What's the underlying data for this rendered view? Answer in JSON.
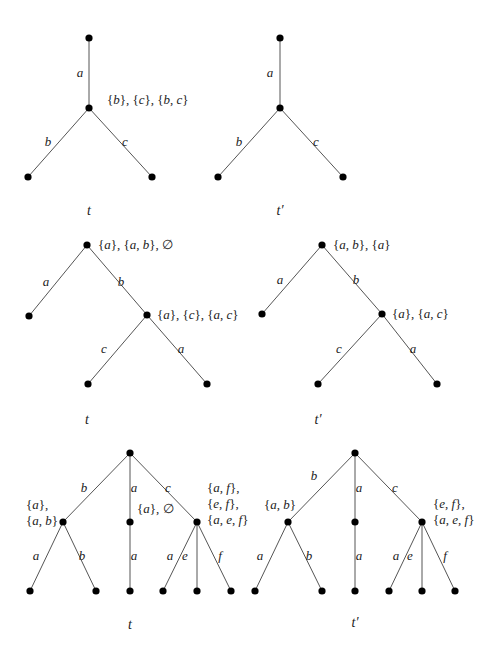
{
  "diagrams": [
    {
      "row": 1,
      "trees": [
        {
          "caption": "t",
          "nodes": [
            [
              89,
              38
            ],
            [
              89,
              108
            ],
            [
              28,
              177
            ],
            [
              152,
              177
            ]
          ],
          "edges": [
            {
              "from": 0,
              "to": 1,
              "label": "a",
              "lx": 80,
              "ly": 77
            },
            {
              "from": 1,
              "to": 2,
              "label": "b",
              "lx": 48,
              "ly": 146
            },
            {
              "from": 1,
              "to": 3,
              "label": "c",
              "lx": 125,
              "ly": 146
            }
          ],
          "annotations": [
            {
              "x": 107,
              "y": 104,
              "lines": [
                "{b}, {c}, {b, c}"
              ]
            }
          ],
          "caption_pos": [
            89,
            215
          ]
        },
        {
          "caption": "t′",
          "nodes": [
            [
              280,
              38
            ],
            [
              280,
              108
            ],
            [
              218,
              177
            ],
            [
              343,
              177
            ]
          ],
          "edges": [
            {
              "from": 0,
              "to": 1,
              "label": "a",
              "lx": 270,
              "ly": 77
            },
            {
              "from": 1,
              "to": 2,
              "label": "b",
              "lx": 239,
              "ly": 146
            },
            {
              "from": 1,
              "to": 3,
              "label": "c",
              "lx": 316,
              "ly": 146
            }
          ],
          "annotations": [],
          "caption_pos": [
            280,
            215
          ]
        }
      ]
    },
    {
      "row": 2,
      "trees": [
        {
          "caption": "t",
          "nodes": [
            [
              87,
              245
            ],
            [
              29,
              316
            ],
            [
              147,
              315
            ],
            [
              88,
              384
            ],
            [
              207,
              384
            ]
          ],
          "edges": [
            {
              "from": 0,
              "to": 1,
              "label": "a",
              "lx": 46,
              "ly": 286
            },
            {
              "from": 0,
              "to": 2,
              "label": "b",
              "lx": 121,
              "ly": 286
            },
            {
              "from": 2,
              "to": 3,
              "label": "c",
              "lx": 104,
              "ly": 353
            },
            {
              "from": 2,
              "to": 4,
              "label": "a",
              "lx": 181,
              "ly": 353
            }
          ],
          "annotations": [
            {
              "x": 98,
              "y": 249,
              "lines": [
                "{a}, {a, b}, ∅"
              ]
            },
            {
              "x": 157,
              "y": 319,
              "lines": [
                "{a}, {c}, {a, c}"
              ]
            }
          ],
          "caption_pos": [
            87,
            424
          ]
        },
        {
          "caption": "t′",
          "nodes": [
            [
              322,
              245
            ],
            [
              262,
              314
            ],
            [
              382,
              314
            ],
            [
              318,
              384
            ],
            [
              437,
              384
            ]
          ],
          "edges": [
            {
              "from": 0,
              "to": 1,
              "label": "a",
              "lx": 280,
              "ly": 284
            },
            {
              "from": 0,
              "to": 2,
              "label": "b",
              "lx": 356,
              "ly": 284
            },
            {
              "from": 2,
              "to": 3,
              "label": "c",
              "lx": 339,
              "ly": 353
            },
            {
              "from": 2,
              "to": 4,
              "label": "a",
              "lx": 413,
              "ly": 353
            }
          ],
          "annotations": [
            {
              "x": 333,
              "y": 249,
              "lines": [
                "{a, b}, {a}"
              ]
            },
            {
              "x": 392,
              "y": 318,
              "lines": [
                "{a}, {a, c}"
              ]
            }
          ],
          "caption_pos": [
            318,
            424
          ]
        }
      ]
    },
    {
      "row": 3,
      "trees": [
        {
          "caption": "t",
          "nodes": [
            [
              130,
              453
            ],
            [
              63,
              522
            ],
            [
              130,
              522
            ],
            [
              197,
              522
            ],
            [
              30,
              591
            ],
            [
              96,
              591
            ],
            [
              130,
              591
            ],
            [
              163,
              591
            ],
            [
              197,
              591
            ],
            [
              231,
              591
            ]
          ],
          "edges": [
            {
              "from": 0,
              "to": 1,
              "label": "b",
              "lx": 84,
              "ly": 492
            },
            {
              "from": 0,
              "to": 2,
              "label": "a",
              "lx": 134,
              "ly": 492
            },
            {
              "from": 0,
              "to": 3,
              "label": "c",
              "lx": 168,
              "ly": 492
            },
            {
              "from": 1,
              "to": 4,
              "label": "a",
              "lx": 36,
              "ly": 560
            },
            {
              "from": 1,
              "to": 5,
              "label": "b",
              "lx": 82,
              "ly": 560
            },
            {
              "from": 2,
              "to": 6,
              "label": "a",
              "lx": 134,
              "ly": 560
            },
            {
              "from": 3,
              "to": 7,
              "label": "a",
              "lx": 170,
              "ly": 560
            },
            {
              "from": 3,
              "to": 8,
              "label": "e",
              "lx": 185,
              "ly": 560
            },
            {
              "from": 3,
              "to": 9,
              "label": "f",
              "lx": 220,
              "ly": 560
            }
          ],
          "annotations": [
            {
              "x": 26,
              "y": 509,
              "lines": [
                "{a},",
                "{a, b}"
              ]
            },
            {
              "x": 137,
              "y": 513,
              "lines": [
                "{a}, ∅"
              ]
            },
            {
              "x": 207,
              "y": 492,
              "lines": [
                "{a, f},",
                "{e, f},",
                "{a, e, f}"
              ]
            }
          ],
          "caption_pos": [
            130,
            629
          ]
        },
        {
          "caption": "t′",
          "nodes": [
            [
              355,
              453
            ],
            [
              288,
              522
            ],
            [
              355,
              522
            ],
            [
              422,
              522
            ],
            [
              255,
              591
            ],
            [
              322,
              591
            ],
            [
              355,
              591
            ],
            [
              389,
              591
            ],
            [
              422,
              591
            ],
            [
              455,
              591
            ]
          ],
          "edges": [
            {
              "from": 0,
              "to": 1,
              "label": "b",
              "lx": 314,
              "ly": 480
            },
            {
              "from": 0,
              "to": 2,
              "label": "a",
              "lx": 359,
              "ly": 492
            },
            {
              "from": 0,
              "to": 3,
              "label": "c",
              "lx": 395,
              "ly": 492
            },
            {
              "from": 1,
              "to": 4,
              "label": "a",
              "lx": 260,
              "ly": 560
            },
            {
              "from": 1,
              "to": 5,
              "label": "b",
              "lx": 309,
              "ly": 560
            },
            {
              "from": 2,
              "to": 6,
              "label": "a",
              "lx": 359,
              "ly": 560
            },
            {
              "from": 3,
              "to": 7,
              "label": "a",
              "lx": 396,
              "ly": 560
            },
            {
              "from": 3,
              "to": 8,
              "label": "e",
              "lx": 410,
              "ly": 560
            },
            {
              "from": 3,
              "to": 9,
              "label": "f",
              "lx": 445,
              "ly": 560
            }
          ],
          "annotations": [
            {
              "x": 264,
              "y": 509,
              "lines": [
                "{a, b}"
              ]
            },
            {
              "x": 433,
              "y": 508,
              "lines": [
                "{e, f},",
                "{a, e, f}"
              ]
            }
          ],
          "caption_pos": [
            355,
            627
          ]
        }
      ]
    }
  ]
}
